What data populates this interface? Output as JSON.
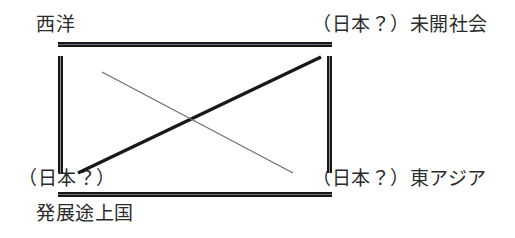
{
  "diagram": {
    "background_color": "#ffffff",
    "ink_color": "#16181a",
    "text_color": "#2b2b2b",
    "labels": {
      "top_left": "西洋",
      "top_right": "（日本？）未開社会",
      "bottom_left": "（日本？）",
      "bottom_right": "（日本？）東アジア",
      "caption_below": "発展途上国"
    },
    "frame": {
      "top_rule": "top-horizontal-rule",
      "bottom_rule": "bottom-horizontal-rule",
      "left_rule": "left-vertical-rule",
      "right_rule": "right-vertical-rule"
    },
    "connectors": [
      {
        "name": "thick-diagonal",
        "from": "bottom-left",
        "to": "top-right",
        "weight": "thick",
        "color": "#16181a"
      },
      {
        "name": "thin-diagonal",
        "from": "top-left",
        "to": "bottom-right",
        "weight": "thin",
        "color": "#6b6e72"
      }
    ]
  }
}
